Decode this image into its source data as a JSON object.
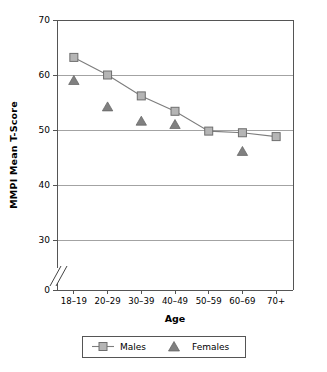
{
  "chart_data": {
    "type": "line",
    "title": "",
    "xlabel": "Age",
    "ylabel": "MMPI Mean T-Score",
    "categories": [
      "18–19",
      "20–29",
      "30–39",
      "40–49",
      "50–59",
      "60–69",
      "70+"
    ],
    "series": [
      {
        "name": "Males",
        "marker": "square",
        "connected": true,
        "color": "#9a9a9a",
        "values": [
          63.2,
          60.0,
          56.2,
          53.4,
          49.8,
          49.5,
          48.8
        ]
      },
      {
        "name": "Females",
        "marker": "triangle",
        "connected": false,
        "color": "#808080",
        "values": [
          59.0,
          54.2,
          51.6,
          51.0,
          null,
          46.1,
          null
        ]
      }
    ],
    "ylim": [
      0,
      70
    ],
    "yticks": [
      0,
      30,
      40,
      50,
      60,
      70
    ],
    "ytick_labels": [
      "0",
      "30",
      "40",
      "50",
      "60",
      "70"
    ],
    "y_axis_break": true,
    "y_axis_break_note": "axis break between 0 and 30",
    "grid": "horizontal",
    "legend_position": "bottom"
  },
  "legend": {
    "males_label": "Males",
    "females_label": "Females"
  },
  "axis": {
    "y_title": "MMPI Mean T-Score",
    "x_title": "Age"
  }
}
